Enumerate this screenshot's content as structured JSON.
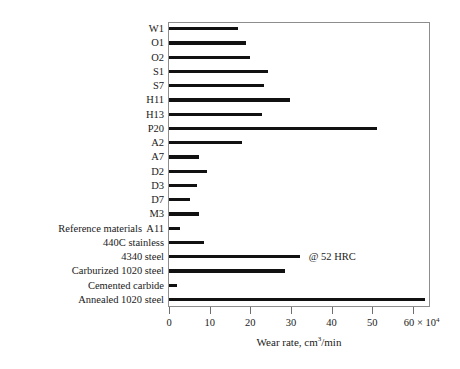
{
  "chart_data": {
    "type": "bar",
    "orientation": "horizontal",
    "title": "",
    "xlabel": "Wear rate, cm3/min",
    "xlabel_parts": {
      "prefix": "Wear rate, cm",
      "superscript": "3",
      "suffix": "/min"
    },
    "ylabel": "",
    "xlim": [
      0,
      64
    ],
    "xticks": [
      0,
      10,
      20,
      30,
      40,
      50,
      60
    ],
    "xticklabels": [
      "0",
      "10",
      "20",
      "30",
      "40",
      "50",
      "60"
    ],
    "xtick_last_multiplier_prefix": "60 × 10",
    "xtick_last_multiplier_exponent": "4",
    "x_scale_note": "values × 10^4",
    "grid": false,
    "legend": false,
    "categories": [
      "W1",
      "O1",
      "O2",
      "S1",
      "S7",
      "H11",
      "H13",
      "P20",
      "A2",
      "A7",
      "D2",
      "D3",
      "D7",
      "M3",
      "A11",
      "440C stainless",
      "4340 steel",
      "Carburized 1020 steel",
      "Cemented carbide",
      "Annealed 1020 steel"
    ],
    "values": [
      17.0,
      18.9,
      20.0,
      24.4,
      23.4,
      29.8,
      22.9,
      51.2,
      18.0,
      7.3,
      9.3,
      6.8,
      5.1,
      7.3,
      2.7,
      8.5,
      32.2,
      28.5,
      2.0,
      63.0
    ],
    "annotations": [
      {
        "category": "4340 steel",
        "text": "@ 52 HRC"
      }
    ],
    "group_labels": [
      {
        "text": "Reference materials",
        "applies_to": [
          "440C stainless",
          "4340 steel",
          "Carburized 1020 steel",
          "Cemented carbide",
          "Annealed 1020 steel"
        ]
      }
    ],
    "bar_color": "#111111",
    "frame_color": "#8d8d8d",
    "background_color": "#ffffff"
  }
}
